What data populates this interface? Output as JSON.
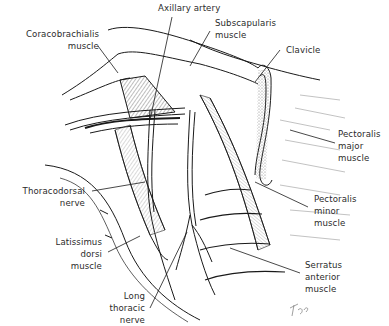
{
  "figure": {
    "type": "anatomical-illustration",
    "signature": "Fro"
  },
  "labels": {
    "axillary_artery": {
      "lines": [
        "Axillary artery"
      ]
    },
    "coracobrachialis": {
      "lines": [
        "Coracobrachialis",
        "muscle"
      ]
    },
    "subscapularis": {
      "lines": [
        "Subscapularis",
        "muscle"
      ]
    },
    "clavicle": {
      "lines": [
        "Clavicle"
      ]
    },
    "pectoralis_major": {
      "lines": [
        "Pectoralis",
        "major",
        "muscle"
      ]
    },
    "thoracodorsal": {
      "lines": [
        "Thoracodorsal",
        "nerve"
      ]
    },
    "pectoralis_minor": {
      "lines": [
        "Pectoralis",
        "minor",
        "muscle"
      ]
    },
    "latissimus_dorsi": {
      "lines": [
        "Latissimus",
        "dorsi",
        "muscle"
      ]
    },
    "serratus_anterior": {
      "lines": [
        "Serratus",
        "anterior",
        "muscle"
      ]
    },
    "long_thoracic": {
      "lines": [
        "Long",
        "thoracic",
        "nerve"
      ]
    }
  },
  "colors": {
    "ink": "#1a1a1a",
    "label": "#2b2b2b",
    "hatch": "#555555",
    "background": "#ffffff"
  }
}
